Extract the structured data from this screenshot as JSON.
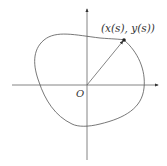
{
  "diagram": {
    "point_label": "(x(s), y(s))",
    "origin_label": "O",
    "colors": {
      "axis": "#555555",
      "curve": "#555555",
      "vector": "#555555",
      "point": "#222222",
      "background": "#ffffff"
    },
    "elements": {
      "x_axis": {
        "from": [
          12,
          85
        ],
        "to": [
          158,
          85
        ],
        "arrow": "right"
      },
      "y_axis": {
        "from": [
          87,
          160
        ],
        "to": [
          87,
          9
        ],
        "arrow": "up"
      },
      "curve": "closed smooth blob around origin",
      "position_vector": {
        "from": [
          87,
          85
        ],
        "to": [
          124,
          40
        ]
      },
      "point": [
        124,
        40
      ]
    }
  }
}
